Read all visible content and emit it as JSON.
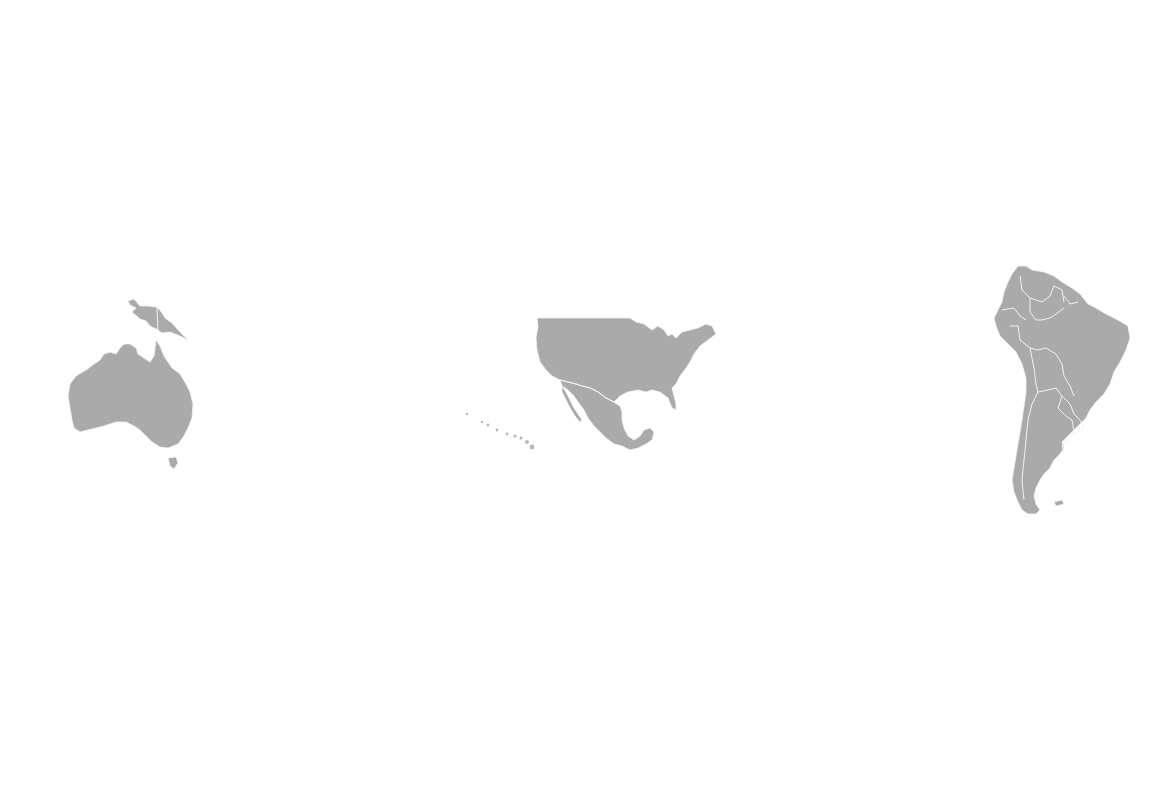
{
  "map": {
    "background": "#ffffff",
    "land_color": "#aaaaaa",
    "border_color": "#f2f2f2",
    "regions": [
      {
        "name": "Australia",
        "group": "oceania"
      },
      {
        "name": "Papua New Guinea",
        "group": "oceania"
      },
      {
        "name": "Tasmania",
        "group": "oceania"
      },
      {
        "name": "Hawaii",
        "group": "north-america"
      },
      {
        "name": "United States",
        "group": "north-america"
      },
      {
        "name": "Mexico",
        "group": "north-america"
      },
      {
        "name": "South America",
        "group": "south-america"
      }
    ]
  }
}
